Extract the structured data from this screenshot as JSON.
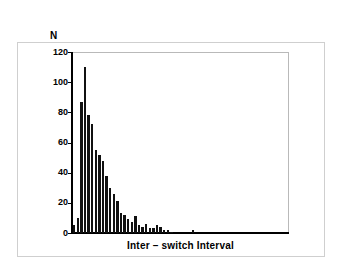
{
  "chart_data": {
    "type": "bar",
    "title": "",
    "subtitle": "",
    "xlabel": "Inter – switch Interval",
    "ylabel": "N",
    "ylim": [
      0,
      120
    ],
    "yticks": [
      0,
      20,
      40,
      60,
      80,
      100,
      120
    ],
    "ytick_labels": [
      "0",
      "20",
      "40",
      "60",
      "80",
      "100",
      "120"
    ],
    "xticks": [],
    "xtick_labels": [],
    "grid": false,
    "legend": null,
    "bar_color": "#111111",
    "n_bins": 60,
    "categories": [
      "1",
      "2",
      "3",
      "4",
      "5",
      "6",
      "7",
      "8",
      "9",
      "10",
      "11",
      "12",
      "13",
      "14",
      "15",
      "16",
      "17",
      "18",
      "19",
      "20",
      "21",
      "22",
      "23",
      "24",
      "25",
      "26",
      "27",
      "28",
      "29",
      "30",
      "31",
      "32",
      "33",
      "34",
      "35",
      "36",
      "37",
      "38",
      "39",
      "40",
      "41",
      "42",
      "43",
      "44",
      "45",
      "46",
      "47",
      "48",
      "49",
      "50",
      "51",
      "52",
      "53",
      "54",
      "55",
      "56",
      "57",
      "58",
      "59",
      "60"
    ],
    "values": [
      5,
      10,
      87,
      110,
      78,
      72,
      55,
      52,
      48,
      38,
      30,
      26,
      21,
      13,
      12,
      9,
      7,
      11,
      5,
      4,
      6,
      3,
      3,
      5,
      4,
      2,
      2,
      1,
      0,
      0,
      0,
      0,
      0,
      2,
      0,
      0,
      0,
      0,
      0,
      0,
      0,
      0,
      0,
      0,
      0,
      0,
      0,
      0,
      0,
      0,
      0,
      0,
      0,
      0,
      0,
      0,
      0,
      0,
      0,
      0
    ]
  },
  "axes": {
    "y_caption": "N",
    "x_title": "Inter – switch Interval"
  }
}
